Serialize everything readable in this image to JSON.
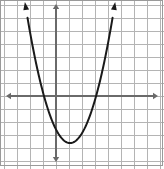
{
  "figure": {
    "width": 164,
    "height": 169,
    "background_color": "#ffffff",
    "border_color": "#9a9a9a"
  },
  "grid": {
    "line_color": "#b4b4b4",
    "line_width": 1,
    "cell_size_px": 13,
    "x_lines_px": [
      4,
      17,
      30,
      43,
      56,
      69,
      82,
      95,
      108,
      121,
      134,
      147,
      160
    ],
    "y_lines_px": [
      5,
      18,
      31,
      44,
      57,
      70,
      83,
      96,
      109,
      122,
      135,
      148,
      161
    ]
  },
  "axes": {
    "color": "#6a6a6a",
    "line_width": 2,
    "x_axis": {
      "name": "x-axis",
      "pixel_y": 96,
      "start_px": 6,
      "end_px": 158,
      "arrow_left": true,
      "arrow_right": true
    },
    "y_axis": {
      "name": "y-axis",
      "pixel_x": 56,
      "start_px": 4,
      "end_px": 162,
      "arrow_up": true,
      "arrow_down": true
    },
    "origin_px": {
      "x": 56,
      "y": 96
    },
    "unit_px": 13
  },
  "chart_data": {
    "type": "line",
    "xlabel": "",
    "ylabel": "",
    "grid": true,
    "legend": null,
    "xlim": [
      -4,
      8
    ],
    "ylim": [
      -5,
      7
    ],
    "xticks": [
      -4,
      -3,
      -2,
      -1,
      0,
      1,
      2,
      3,
      4,
      5,
      6,
      7,
      8
    ],
    "yticks": [
      -5,
      -4,
      -3,
      -2,
      -1,
      0,
      1,
      2,
      3,
      4,
      5,
      6,
      7
    ],
    "tick_labels_shown": false,
    "curve": {
      "name": "parabola",
      "color": "#1a1a1a",
      "line_width": 2,
      "opens": "up",
      "vertex": [
        1.08,
        -3.62
      ],
      "roots": [
        -0.92,
        3.08
      ],
      "leading_coefficient": 0.9,
      "equation": "y = 0.9(x - 1.08)^2 - 3.62",
      "arrow_start": true,
      "arrow_end": true,
      "x": [
        -1.92,
        -1.7,
        -1.5,
        -1.3,
        -1.1,
        -0.9,
        -0.7,
        -0.5,
        -0.3,
        -0.1,
        0.1,
        0.3,
        0.5,
        0.7,
        0.9,
        1.08,
        1.3,
        1.5,
        1.7,
        1.9,
        2.1,
        2.3,
        2.5,
        2.7,
        2.9,
        3.1,
        3.3,
        3.5,
        3.7,
        3.9,
        4.08
      ],
      "y": [
        4.5,
        3.23,
        2.18,
        1.23,
        0.38,
        -0.37,
        -1.02,
        -1.57,
        -2.02,
        -2.37,
        -2.62,
        -2.77,
        -2.94,
        -3.23,
        -3.59,
        -3.62,
        -3.58,
        -3.44,
        -3.2,
        -2.86,
        -2.42,
        -1.88,
        -1.24,
        -0.5,
        0.34,
        1.28,
        2.32,
        3.46,
        4.7,
        6.04,
        7.0
      ]
    },
    "curve_pixel_points": [
      [
        26.0,
        4.0
      ],
      [
        28.9,
        16.9
      ],
      [
        31.5,
        27.2
      ],
      [
        34.1,
        36.1
      ],
      [
        36.7,
        44.2
      ],
      [
        39.3,
        51.3
      ],
      [
        41.9,
        57.5
      ],
      [
        44.5,
        62.8
      ],
      [
        47.1,
        67.1
      ],
      [
        49.7,
        70.6
      ],
      [
        52.3,
        73.2
      ],
      [
        54.9,
        74.9
      ],
      [
        57.5,
        76.5
      ],
      [
        60.1,
        79.2
      ],
      [
        62.7,
        82.7
      ],
      [
        70.0,
        143.0
      ],
      [
        72.9,
        142.5
      ],
      [
        75.5,
        141.0
      ],
      [
        78.1,
        138.6
      ],
      [
        80.7,
        135.2
      ],
      [
        83.3,
        131.0
      ],
      [
        85.9,
        125.8
      ],
      [
        88.5,
        119.6
      ],
      [
        91.1,
        112.5
      ],
      [
        93.7,
        104.5
      ],
      [
        96.3,
        95.4
      ],
      [
        98.9,
        85.5
      ],
      [
        101.5,
        74.6
      ],
      [
        104.1,
        62.8
      ],
      [
        106.7,
        50.0
      ],
      [
        107.0,
        4.0
      ]
    ]
  }
}
